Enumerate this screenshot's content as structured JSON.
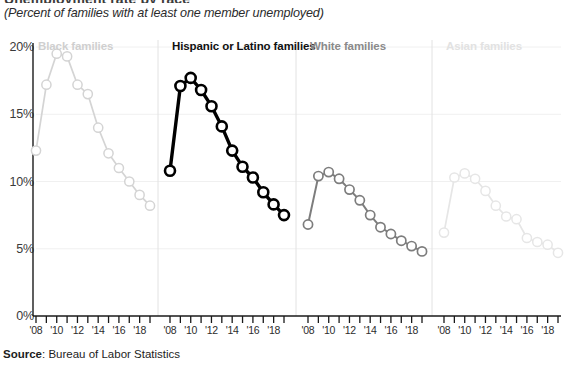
{
  "header": {
    "cut_off_title": "Unemployment rate by race",
    "subtitle": "(Percent of families with at least one member unemployed)"
  },
  "source": {
    "label": "Source",
    "separator": ": ",
    "value": "Bureau of Labor Statistics"
  },
  "axis": {
    "y_ticks": [
      "0%",
      "5%",
      "10%",
      "15%",
      "20%"
    ],
    "y_tick_values": [
      0,
      5,
      10,
      15,
      20
    ],
    "x_tick_labels": [
      "'08",
      "'10",
      "'12",
      "'14",
      "'16",
      "'18"
    ],
    "x_tick_years": [
      2008,
      2010,
      2012,
      2014,
      2016,
      2018
    ],
    "x_all_years": [
      2008,
      2009,
      2010,
      2011,
      2012,
      2013,
      2014,
      2015,
      2016,
      2017,
      2018,
      2019
    ]
  },
  "colors": {
    "highlight": "#000000",
    "white_panel": "#7d7d7d",
    "black_panel": "#d4d4d4",
    "asian_panel": "#e6e6e6",
    "gridline": "#f0f0f0",
    "divider": "#e2e2e2",
    "axis": "#1a1a1a"
  },
  "chart_data": {
    "type": "line",
    "title": "Unemployment rate by race",
    "subtitle": "(Percent of families with at least one member unemployed)",
    "xlabel": "",
    "ylabel": "Percent of families with at least one member unemployed",
    "ylim": [
      0,
      20
    ],
    "xlim": [
      2008,
      2019
    ],
    "grid": true,
    "legend_position": "panel-titles",
    "small_multiples": true,
    "x": [
      2008,
      2009,
      2010,
      2011,
      2012,
      2013,
      2014,
      2015,
      2016,
      2017,
      2018,
      2019
    ],
    "series": [
      {
        "name": "Black families",
        "panel": 0,
        "emphasis": "faint",
        "color": "#d4d4d4",
        "values": [
          12.3,
          17.2,
          19.5,
          19.3,
          17.2,
          16.5,
          14.0,
          12.1,
          11.0,
          10.0,
          9.0,
          8.2
        ]
      },
      {
        "name": "Hispanic or Latino families",
        "panel": 1,
        "emphasis": "strong",
        "color": "#000000",
        "values": [
          10.8,
          17.1,
          17.7,
          16.8,
          15.6,
          14.1,
          12.3,
          11.1,
          10.3,
          9.2,
          8.3,
          7.5
        ]
      },
      {
        "name": "White families",
        "panel": 2,
        "emphasis": "medium",
        "color": "#7d7d7d",
        "values": [
          6.8,
          10.4,
          10.7,
          10.2,
          9.4,
          8.6,
          7.5,
          6.6,
          6.1,
          5.6,
          5.2,
          4.8
        ]
      },
      {
        "name": "Asian families",
        "panel": 3,
        "emphasis": "faintest",
        "color": "#e6e6e6",
        "values": [
          6.2,
          10.3,
          10.6,
          10.2,
          9.3,
          8.2,
          7.4,
          7.2,
          5.8,
          5.5,
          5.3,
          4.7
        ]
      }
    ]
  }
}
